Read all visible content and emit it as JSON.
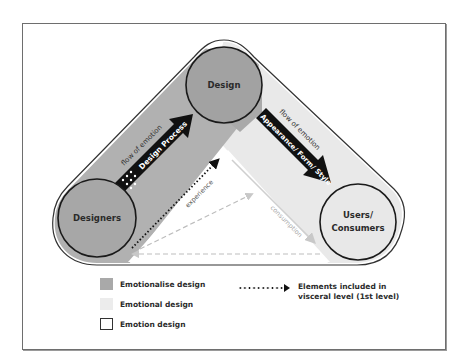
{
  "diagram": {
    "nodes": [
      {
        "id": "designers",
        "label": "Designers"
      },
      {
        "id": "design",
        "label": "Design"
      },
      {
        "id": "users",
        "label_line1": "Users/",
        "label_line2": "Consumers"
      }
    ],
    "edges": {
      "left_flow": "flow of emotion",
      "left_arrow": "Design Process",
      "right_flow": "flow of emotion",
      "right_arrow": "Appearance/ Form/ Style",
      "experience": "experience",
      "consumption": "consumption"
    },
    "colors": {
      "emotionalise": "#a9a9a9",
      "emotional": "#ececec",
      "emotion": "#ffffff",
      "arrow": "#111111"
    }
  },
  "legend": {
    "items": [
      {
        "label": "Emotionalise design",
        "swatch": "dark"
      },
      {
        "label": "Emotional design",
        "swatch": "light"
      },
      {
        "label": "Emotion design",
        "swatch": "white"
      }
    ],
    "arrow_line1": "Elements included in",
    "arrow_line2": "visceral level (1st level)"
  }
}
